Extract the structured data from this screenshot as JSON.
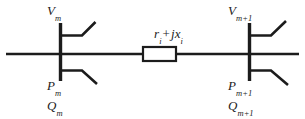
{
  "diagram": {
    "background_color": "#ffffff",
    "line_color": "#1c1c1c",
    "buses": [
      {
        "id": "bus-m",
        "voltage_label": "V",
        "voltage_subscript": "m",
        "active_power_label": "P",
        "active_power_subscript": "m",
        "reactive_power_label": "Q",
        "reactive_power_subscript": "m"
      },
      {
        "id": "bus-m-plus-1",
        "voltage_label": "V",
        "voltage_subscript": "m+1",
        "active_power_label": "P",
        "active_power_subscript": "m+1",
        "reactive_power_label": "Q",
        "reactive_power_subscript": "m+1"
      }
    ],
    "branch": {
      "id": "branch-i",
      "resistance_label": "r",
      "resistance_subscript": "i",
      "plus_operator": "+",
      "imaginary_unit": "j",
      "reactance_label": "x",
      "reactance_subscript": "i"
    }
  }
}
